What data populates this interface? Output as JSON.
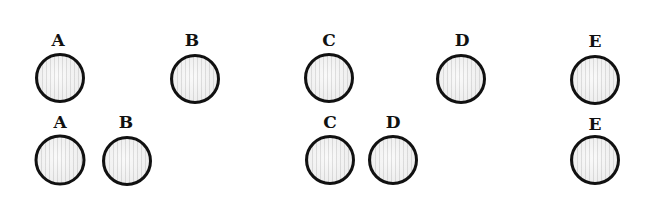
{
  "figure": {
    "disc_radius": 25,
    "rows": [
      {
        "name": "top-row",
        "label_y": 40,
        "disc_y": 78,
        "items": [
          {
            "label": "A",
            "x": 60
          },
          {
            "label": "B",
            "x": 195
          },
          {
            "label": "C",
            "x": 329
          },
          {
            "label": "D",
            "x": 461
          },
          {
            "label": "E",
            "x": 595
          }
        ]
      },
      {
        "name": "bottom-row",
        "label_y": 122,
        "disc_y": 160,
        "items": [
          {
            "label": "A",
            "x": 60
          },
          {
            "label": "B",
            "x": 127
          },
          {
            "label": "C",
            "x": 329
          },
          {
            "label": "D",
            "x": 393
          },
          {
            "label": "E",
            "x": 595
          }
        ]
      }
    ]
  }
}
